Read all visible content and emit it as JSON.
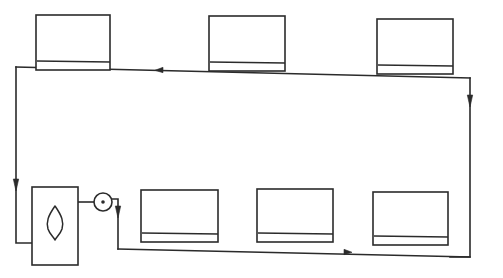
{
  "diagram": {
    "title": "Central heating circuit schematic",
    "type": "schematic-line-drawing",
    "canvas": {
      "width": 503,
      "height": 278
    },
    "background_color": "#ffffff",
    "line_color": "#2b2b2b"
  },
  "components": {
    "boiler": {
      "label": "boiler",
      "symbol": "flame",
      "x": 32,
      "y": 187,
      "width": 46,
      "height": 78
    },
    "pump": {
      "label": "pump",
      "symbol": "circle-with-center-dot",
      "cx": 103,
      "cy": 202,
      "r": 9
    },
    "radiators_top": [
      {
        "label": "radiator-top-1",
        "x": 36,
        "y": 15,
        "width": 74,
        "height": 55
      },
      {
        "label": "radiator-top-2",
        "x": 209,
        "y": 16,
        "width": 76,
        "height": 55
      },
      {
        "label": "radiator-top-3",
        "x": 377,
        "y": 19,
        "width": 76,
        "height": 55
      }
    ],
    "radiators_bottom": [
      {
        "label": "radiator-bottom-1",
        "x": 141,
        "y": 190,
        "width": 77,
        "height": 52
      },
      {
        "label": "radiator-bottom-2",
        "x": 257,
        "y": 189,
        "width": 76,
        "height": 53
      },
      {
        "label": "radiator-bottom-3",
        "x": 373,
        "y": 192,
        "width": 75,
        "height": 53
      }
    ]
  },
  "pipes": {
    "flow_top_label": "return header (top)",
    "flow_bottom_label": "flow header (bottom)",
    "left_riser_label": "left riser",
    "right_riser_label": "right riser"
  },
  "flow_arrows": [
    {
      "name": "arrow-top-left-flow",
      "x": 160,
      "y": 70,
      "direction": "left"
    },
    {
      "name": "arrow-left-riser-down",
      "x": 16,
      "y": 185,
      "direction": "down"
    },
    {
      "name": "arrow-right-riser-down",
      "x": 470,
      "y": 101,
      "direction": "down"
    },
    {
      "name": "arrow-bottom-right-flow",
      "x": 347,
      "y": 252,
      "direction": "right"
    },
    {
      "name": "arrow-pump-outlet-down",
      "x": 118,
      "y": 212,
      "direction": "down"
    }
  ]
}
